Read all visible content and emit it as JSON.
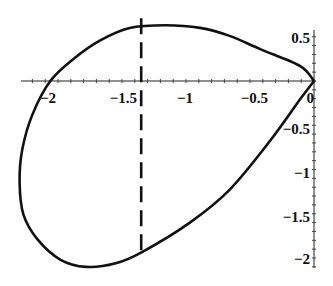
{
  "chart_data": {
    "type": "line",
    "title": "",
    "xlabel": "",
    "ylabel": "",
    "xlim": [
      -2.3,
      0
    ],
    "ylim": [
      -2.12,
      0.7
    ],
    "grid": false,
    "legend": null,
    "x_ticks": [
      "-2",
      "-1.5",
      "-1",
      "-0.5",
      "0"
    ],
    "x_tick_values": [
      -2,
      -1.5,
      -1,
      -0.5,
      0
    ],
    "y_ticks": [
      "0.5",
      "-0.5",
      "-1",
      "-1.5",
      "-2"
    ],
    "y_tick_values": [
      0.5,
      -0.5,
      -1,
      -1.5,
      -2
    ],
    "series": [
      {
        "name": "closed curve",
        "style": "solid",
        "color": "#111111",
        "x": [
          0,
          -0.11,
          -0.42,
          -0.66,
          -0.89,
          -1.16,
          -1.44,
          -1.67,
          -1.87,
          -2.06,
          -2.2,
          -2.28,
          -2.3,
          -2.27,
          -2.16,
          -1.98,
          -1.78,
          -1.55,
          -1.34,
          -0.97,
          -0.66,
          -0.34,
          -0.11,
          0
        ],
        "y": [
          0,
          0.17,
          0.36,
          0.51,
          0.6,
          0.63,
          0.6,
          0.46,
          0.26,
          0,
          -0.38,
          -0.78,
          -1.15,
          -1.51,
          -1.79,
          -2.02,
          -2.1,
          -2.06,
          -1.93,
          -1.6,
          -1.23,
          -0.67,
          -0.21,
          0
        ]
      },
      {
        "name": "vertical line",
        "style": "dashed",
        "color": "#111111",
        "x": [
          -1.35,
          -1.35
        ],
        "y": [
          0.71,
          -1.99
        ]
      }
    ]
  },
  "labels": {
    "x": [
      "−2",
      "−1.5",
      "−1",
      "−0.5",
      "0"
    ],
    "y": [
      "0.5",
      "−0.5",
      "−1",
      "−1.5",
      "−2"
    ]
  }
}
